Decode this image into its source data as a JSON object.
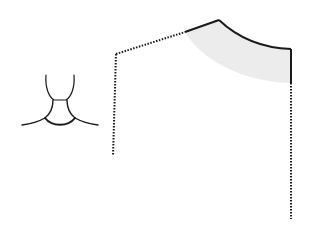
{
  "diagram": {
    "type": "sewing-pattern-neckline",
    "colors": {
      "background": "#ffffff",
      "stroke": "#1a1a1a",
      "highlight_fill": "#ececec"
    },
    "icon": {
      "name": "neck-shoulders-icon",
      "description": "outline of head, neck and shoulders"
    },
    "pattern": {
      "description": "bodice front pattern piece with highlighted neckline region",
      "solid_edges": [
        "shoulder-segment",
        "neckline-curve",
        "center-front-top"
      ],
      "dotted_edges": [
        "left-shoulder-line",
        "left-side-seam",
        "right-center-line"
      ]
    }
  }
}
